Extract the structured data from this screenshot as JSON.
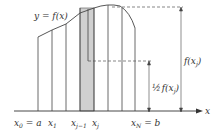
{
  "diagram": {
    "curve_label": "y = f(x)",
    "axis_label": "x",
    "tick_labels": {
      "x0": "x",
      "x0_sub": "0",
      "x0_rest": " = a",
      "x1": "x",
      "x1_sub": "1",
      "xjm1": "x",
      "xjm1_sub": "j−1",
      "xj": "x",
      "xj_sub": "j",
      "xN": "x",
      "xN_sub": "N",
      "xN_rest": " = b"
    },
    "height_label": "f(x",
    "height_label_sub": "j",
    "height_label_end": ")",
    "half_height_label_frac": "½",
    "half_height_label": "f(x",
    "half_height_label_sub": "j",
    "half_height_label_end": ")",
    "colors": {
      "line": "#333333",
      "shade": "#d0d0d0",
      "dashed": "#555555"
    }
  }
}
